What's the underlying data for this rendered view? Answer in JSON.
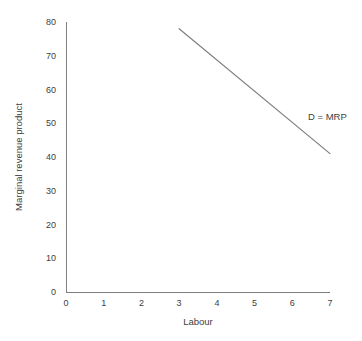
{
  "chart_data": {
    "type": "line",
    "title": "",
    "subtitle": "",
    "xlabel": "Labour",
    "ylabel": "Marginal revenue product",
    "xlim": [
      0,
      7
    ],
    "ylim": [
      0,
      80
    ],
    "xticks": [
      "0",
      "1",
      "2",
      "3",
      "4",
      "5",
      "6",
      "7"
    ],
    "yticks": [
      "0",
      "10",
      "20",
      "30",
      "40",
      "50",
      "60",
      "70",
      "80"
    ],
    "grid": false,
    "legend_position": "inline-annotation-right",
    "series": [
      {
        "name": "D = MRP",
        "x": [
          3,
          7
        ],
        "values": [
          78,
          41
        ],
        "color": "#7f7f7f",
        "annotation": "D = MRP"
      }
    ],
    "annotations": [
      {
        "text": "D = MRP",
        "x": 7.1,
        "y": 50
      }
    ]
  },
  "axes": {
    "axis_color": "#808080",
    "text_color": "#404040",
    "background": "#ffffff"
  }
}
